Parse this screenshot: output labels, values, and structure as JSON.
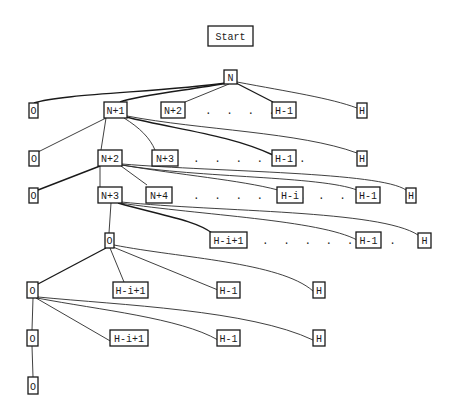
{
  "title": "Start",
  "colors": {
    "ink": "#1a1a1a",
    "paper": "#ffffff"
  },
  "nodes": {
    "start": {
      "label": "Start",
      "x": 208,
      "y": 26,
      "w": 45,
      "h": 20
    },
    "n": {
      "label": "N",
      "x": 224,
      "y": 70,
      "w": 13,
      "h": 14
    },
    "r1_o": {
      "label": "O",
      "x": 29,
      "y": 103,
      "w": 9,
      "h": 15
    },
    "r1_n1": {
      "label": "N+1",
      "x": 104,
      "y": 102,
      "w": 23,
      "h": 16
    },
    "r1_n2": {
      "label": "N+2",
      "x": 161,
      "y": 102,
      "w": 24,
      "h": 16
    },
    "r1_h1": {
      "label": "H-1",
      "x": 272,
      "y": 102,
      "w": 24,
      "h": 16
    },
    "r1_h": {
      "label": "H",
      "x": 357,
      "y": 103,
      "w": 10,
      "h": 15
    },
    "r2_o": {
      "label": "O",
      "x": 29,
      "y": 151,
      "w": 10,
      "h": 15
    },
    "r2_n2": {
      "label": "N+2",
      "x": 98,
      "y": 150,
      "w": 24,
      "h": 16
    },
    "r2_n3": {
      "label": "N+3",
      "x": 152,
      "y": 150,
      "w": 26,
      "h": 16
    },
    "r2_h1": {
      "label": "H-1",
      "x": 272,
      "y": 150,
      "w": 24,
      "h": 16
    },
    "r2_h": {
      "label": "H",
      "x": 357,
      "y": 151,
      "w": 10,
      "h": 15
    },
    "r3_o": {
      "label": "O",
      "x": 29,
      "y": 188,
      "w": 9,
      "h": 15
    },
    "r3_n3": {
      "label": "N+3",
      "x": 98,
      "y": 187,
      "w": 24,
      "h": 16
    },
    "r3_n4": {
      "label": "N+4",
      "x": 146,
      "y": 187,
      "w": 26,
      "h": 16
    },
    "r3_hi": {
      "label": "H-i",
      "x": 277,
      "y": 187,
      "w": 26,
      "h": 16
    },
    "r3_h1": {
      "label": "H-1",
      "x": 356,
      "y": 187,
      "w": 24,
      "h": 16
    },
    "r3_h": {
      "label": "H",
      "x": 406,
      "y": 188,
      "w": 10,
      "h": 15
    },
    "r4_o": {
      "label": "O",
      "x": 105,
      "y": 233,
      "w": 9,
      "h": 15
    },
    "r4_hi1": {
      "label": "H-i+1",
      "x": 210,
      "y": 232,
      "w": 37,
      "h": 16
    },
    "r4_h1": {
      "label": "H-1",
      "x": 356,
      "y": 232,
      "w": 25,
      "h": 16
    },
    "r4_h": {
      "label": "H",
      "x": 418,
      "y": 233,
      "w": 13,
      "h": 15
    },
    "r5_o": {
      "label": "O",
      "x": 27,
      "y": 282,
      "w": 11,
      "h": 16
    },
    "r5_hi1": {
      "label": "H-i+1",
      "x": 113,
      "y": 282,
      "w": 35,
      "h": 16
    },
    "r5_h1": {
      "label": "H-1",
      "x": 217,
      "y": 282,
      "w": 23,
      "h": 16
    },
    "r5_h": {
      "label": "H",
      "x": 313,
      "y": 282,
      "w": 12,
      "h": 16
    },
    "r6_o": {
      "label": "O",
      "x": 27,
      "y": 330,
      "w": 11,
      "h": 16
    },
    "r6_hi1": {
      "label": "H-i+1",
      "x": 110,
      "y": 330,
      "w": 38,
      "h": 16
    },
    "r6_h1": {
      "label": "H-1",
      "x": 217,
      "y": 330,
      "w": 23,
      "h": 16
    },
    "r6_h": {
      "label": "H",
      "x": 313,
      "y": 330,
      "w": 12,
      "h": 16
    },
    "r7_o": {
      "label": "O",
      "x": 28,
      "y": 377,
      "w": 10,
      "h": 17
    }
  },
  "ellipses": [
    {
      "text": ". . . .",
      "x": 205,
      "y": 114
    },
    {
      "text": ". . . . . .",
      "x": 193,
      "y": 162
    },
    {
      "text": ". . . . . .",
      "x": 193,
      "y": 199
    },
    {
      "text": ". . .",
      "x": 318,
      "y": 199
    },
    {
      "text": ". . . . . . .",
      "x": 262,
      "y": 244
    }
  ]
}
